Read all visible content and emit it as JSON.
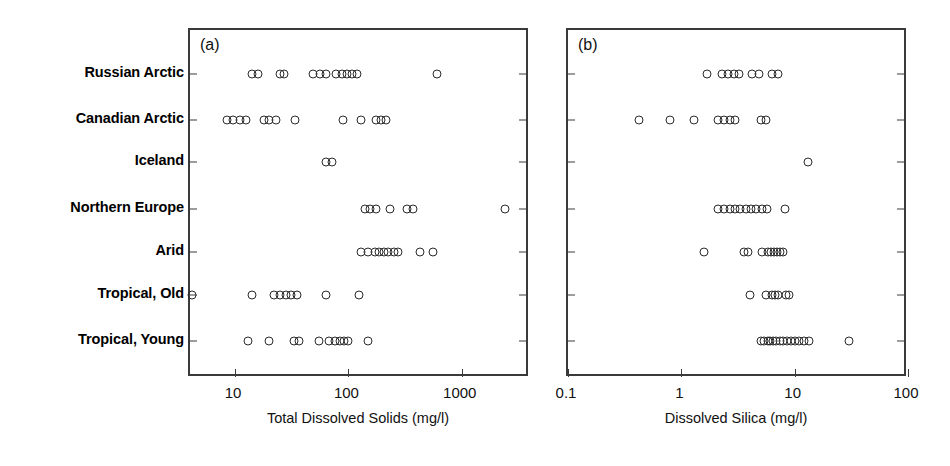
{
  "figure": {
    "width": 950,
    "height": 466,
    "background": "#ffffff",
    "marker_color": "#2b2b2b",
    "axis_color": "#3a3a3a"
  },
  "categories": [
    "Russian Arctic",
    "Canadian Arctic",
    "Iceland",
    "Northern Europe",
    "Arid",
    "Tropical, Old",
    "Tropical, Young"
  ],
  "panels": [
    {
      "tag": "(a)",
      "xlabel": "Total Dissolved Solids (mg/l)",
      "xscale": "log",
      "xlim": [
        4.0,
        4000.0
      ],
      "xticks": [
        10,
        100,
        1000
      ],
      "xticklabels": [
        "10",
        "100",
        "1000"
      ]
    },
    {
      "tag": "(b)",
      "xlabel": "Dissolved Silica (mg/l)",
      "xscale": "log",
      "xlim": [
        0.1,
        100.0
      ],
      "xticks": [
        0.1,
        1,
        10,
        100
      ],
      "xticklabels": [
        "0.1",
        "1",
        "10",
        "100"
      ]
    }
  ],
  "chart_data": [
    {
      "type": "scatter",
      "title": "(a)",
      "xlabel": "Total Dissolved Solids (mg/l)",
      "ylabel": "",
      "xscale": "log",
      "xlim": [
        4.0,
        4000.0
      ],
      "xticks": [
        10,
        100,
        1000
      ],
      "grid": false,
      "legend": "none",
      "categories": [
        "Russian Arctic",
        "Canadian Arctic",
        "Iceland",
        "Northern Europe",
        "Arid",
        "Tropical, Old",
        "Tropical, Young"
      ],
      "series": [
        {
          "name": "Russian Arctic",
          "values": [
            14,
            16,
            25,
            27,
            49,
            56,
            64,
            78,
            88,
            97,
            108,
            118,
            600
          ]
        },
        {
          "name": "Canadian Arctic",
          "values": [
            8.5,
            9.5,
            11,
            12.5,
            18,
            20,
            23,
            34,
            90,
            130,
            175,
            195,
            215
          ]
        },
        {
          "name": "Iceland",
          "values": [
            63,
            72
          ]
        },
        {
          "name": "Northern Europe",
          "values": [
            140,
            155,
            175,
            235,
            330,
            370,
            2400
          ]
        },
        {
          "name": "Arid",
          "values": [
            130,
            150,
            170,
            185,
            205,
            225,
            250,
            275,
            430,
            560
          ]
        },
        {
          "name": "Tropical, Old",
          "values": [
            4.2,
            14,
            22,
            25,
            28,
            31,
            35,
            63,
            125
          ]
        },
        {
          "name": "Tropical, Young",
          "values": [
            13,
            20,
            33,
            37,
            55,
            68,
            76,
            84,
            92,
            100,
            150
          ]
        }
      ]
    },
    {
      "type": "scatter",
      "title": "(b)",
      "xlabel": "Dissolved Silica (mg/l)",
      "ylabel": "",
      "xscale": "log",
      "xlim": [
        0.1,
        100.0
      ],
      "xticks": [
        0.1,
        1,
        10,
        100
      ],
      "grid": false,
      "legend": "none",
      "categories": [
        "Russian Arctic",
        "Canadian Arctic",
        "Iceland",
        "Northern Europe",
        "Arid",
        "Tropical, Old",
        "Tropical, Young"
      ],
      "series": [
        {
          "name": "Russian Arctic",
          "values": [
            1.7,
            2.3,
            2.6,
            2.9,
            3.2,
            4.2,
            4.8,
            6.3,
            7.1
          ]
        },
        {
          "name": "Canadian Arctic",
          "values": [
            0.42,
            0.8,
            1.3,
            2.1,
            2.4,
            2.7,
            3.0,
            5.0,
            5.6
          ]
        },
        {
          "name": "Iceland",
          "values": [
            13.0
          ]
        },
        {
          "name": "Northern Europe",
          "values": [
            2.1,
            2.4,
            2.7,
            3.0,
            3.3,
            3.7,
            4.1,
            4.6,
            5.1,
            5.7,
            8.2
          ]
        },
        {
          "name": "Arid",
          "values": [
            1.6,
            3.6,
            3.9,
            5.2,
            5.8,
            6.2,
            6.6,
            7.0,
            7.4,
            7.9
          ]
        },
        {
          "name": "Tropical, Old",
          "values": [
            4.0,
            5.6,
            6.3,
            6.7,
            7.1,
            8.4,
            8.9
          ]
        },
        {
          "name": "Tropical, Young",
          "values": [
            5.0,
            5.4,
            5.8,
            6.1,
            6.5,
            6.9,
            7.4,
            7.9,
            8.5,
            9.2,
            10.0,
            11.0,
            12.0,
            13.5,
            30.0
          ]
        }
      ]
    }
  ]
}
